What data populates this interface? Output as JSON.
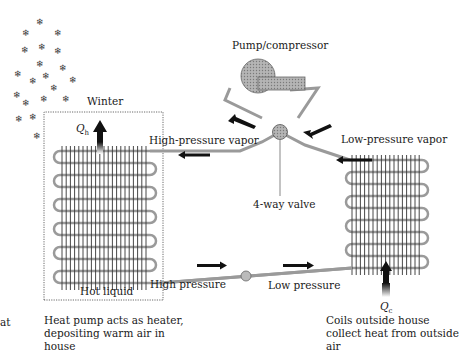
{
  "diagram": {
    "season_label": "Winter",
    "components": {
      "compressor": "Pump/compressor",
      "valve": "4-way valve"
    },
    "line_labels": {
      "high_pressure_vapor": "High-pressure vapor",
      "low_pressure_vapor": "Low-pressure vapor",
      "high_pressure": "High  pressure",
      "low_pressure": "Low pressure",
      "hot_liquid": "Hot liquid"
    },
    "heat_flows": {
      "qh": {
        "symbol": "Q",
        "subscript": "h"
      },
      "qc": {
        "symbol": "Q",
        "subscript": "c"
      }
    },
    "captions": {
      "indoor": "Heat pump acts as heater, depositing warm air in house",
      "outdoor": "Coils outside house collect heat from outside air",
      "cropped_left": "at"
    },
    "icons": {
      "snowflake": "❄"
    },
    "colors": {
      "pipe": "#9a9a9a",
      "arrow": "#111111",
      "coil": "#555555",
      "compressor_fill": "#a8a8a8"
    }
  }
}
